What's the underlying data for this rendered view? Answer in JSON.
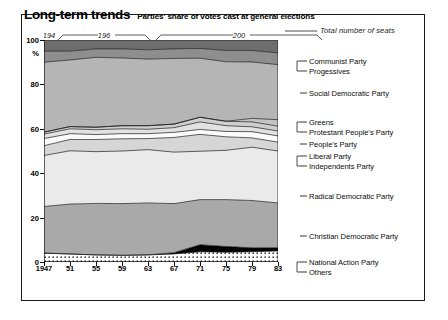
{
  "figure": {
    "title": "Long-term trends",
    "subtitle": "Parties' share of votes cast at general elections",
    "seats_note": "Total number of seats",
    "percent_symbol": "%"
  },
  "decade_brackets": [
    {
      "label": "194",
      "x_start": 0,
      "x_end": 10
    },
    {
      "label": "196",
      "x_start": 14,
      "x_end": 106
    },
    {
      "label": "200",
      "x_start": 112,
      "x_end": 278
    }
  ],
  "chart_data": {
    "type": "area",
    "title": "Long-term trends",
    "subtitle": "Parties' share of votes cast at general elections",
    "stacked": true,
    "normalized": true,
    "xlabel": "",
    "ylabel": "%",
    "xlim": [
      1947,
      1983
    ],
    "ylim": [
      0,
      100
    ],
    "grid": false,
    "legend_position": "right-outside",
    "x": [
      1947,
      1951,
      1955,
      1959,
      1963,
      1967,
      1971,
      1975,
      1979,
      1983
    ],
    "xtick_labels": [
      "1947",
      "51",
      "55",
      "59",
      "63",
      "67",
      "71",
      "75",
      "79",
      "83"
    ],
    "ytick_labels": [
      "0",
      "20",
      "40",
      "60",
      "80",
      "100"
    ],
    "ytick_values": [
      0,
      20,
      40,
      60,
      80,
      100
    ],
    "series_order_bottom_to_top": [
      "Others",
      "National Action Party",
      "Christian Democratic Party",
      "Radical Democratic Party",
      "Independents Party",
      "Liberal Party",
      "People's Party",
      "Protestant People's Party",
      "Greens",
      "Social Democratic Party",
      "Progessives",
      "Communist Party"
    ],
    "series": [
      {
        "name": "Others",
        "color": "#ffffff",
        "pattern": "dots",
        "values": [
          4.0,
          3.6,
          3.2,
          3.0,
          3.2,
          3.6,
          4.6,
          4.4,
          4.6,
          5.0
        ]
      },
      {
        "name": "National Action Party",
        "color": "#000000",
        "pattern": "solid",
        "values": [
          0.0,
          0.0,
          0.0,
          0.0,
          0.0,
          0.6,
          3.2,
          2.6,
          1.8,
          1.4
        ]
      },
      {
        "name": "Christian Democratic Party",
        "color": "#a9a9a9",
        "pattern": "solid",
        "values": [
          21.0,
          22.5,
          23.2,
          23.3,
          23.4,
          22.1,
          20.3,
          21.1,
          21.3,
          20.2
        ]
      },
      {
        "name": "Radical Democratic Party",
        "color": "#eaeaea",
        "pattern": "solid",
        "values": [
          23.0,
          24.0,
          23.3,
          23.7,
          24.0,
          23.2,
          21.8,
          22.2,
          24.0,
          23.4
        ]
      },
      {
        "name": "Independents Party",
        "color": "#d6d6d6",
        "pattern": "solid",
        "values": [
          4.4,
          5.1,
          5.5,
          5.5,
          5.0,
          6.6,
          7.6,
          6.1,
          4.2,
          4.0
        ]
      },
      {
        "name": "Liberal Party",
        "color": "#fbfbfb",
        "pattern": "solid",
        "values": [
          3.2,
          2.6,
          2.2,
          2.3,
          2.2,
          2.3,
          2.2,
          2.4,
          2.8,
          2.8
        ]
      },
      {
        "name": "People's Party",
        "color": "#e2e2e2",
        "pattern": "solid",
        "values": [
          2.0,
          2.2,
          2.2,
          2.2,
          2.0,
          2.1,
          3.4,
          2.6,
          2.2,
          2.2
        ]
      },
      {
        "name": "Protestant People's Party",
        "color": "#cfcfcf",
        "pattern": "solid",
        "values": [
          0.9,
          1.0,
          1.1,
          1.4,
          1.6,
          1.6,
          2.1,
          2.0,
          2.2,
          2.2
        ]
      },
      {
        "name": "Greens",
        "color": "#c4c4c4",
        "pattern": "solid",
        "values": [
          0.0,
          0.0,
          0.0,
          0.0,
          0.0,
          0.0,
          0.0,
          0.0,
          1.6,
          2.9
        ]
      },
      {
        "name": "Social Democratic Party",
        "color": "#b5b5b5",
        "pattern": "solid",
        "values": [
          31.5,
          30.0,
          31.5,
          30.5,
          30.0,
          29.6,
          26.6,
          26.8,
          25.4,
          24.8
        ]
      },
      {
        "name": "Progessives",
        "color": "#8e8e8e",
        "pattern": "solid",
        "values": [
          5.0,
          4.0,
          3.8,
          4.1,
          4.2,
          4.3,
          4.4,
          5.1,
          5.2,
          5.3
        ]
      },
      {
        "name": "Communist Party",
        "color": "#6e6e6e",
        "pattern": "solid",
        "values": [
          5.0,
          5.0,
          4.0,
          4.0,
          4.4,
          4.0,
          3.8,
          4.7,
          4.7,
          5.8
        ]
      }
    ]
  },
  "legend": [
    {
      "label": "Communist Party",
      "y": 61
    },
    {
      "label": "Progessives",
      "y": 71
    },
    {
      "label": "Social Democratic Party",
      "y": 93
    },
    {
      "label": "Greens",
      "y": 122
    },
    {
      "label": "Protestant People's Party",
      "y": 132
    },
    {
      "label": "People's Party",
      "y": 144
    },
    {
      "label": "Liberal Party",
      "y": 156
    },
    {
      "label": "Independents Party",
      "y": 166
    },
    {
      "label": "Radical Democratic Party",
      "y": 196
    },
    {
      "label": "Christian Democratic Party",
      "y": 236
    },
    {
      "label": "National Action Party",
      "y": 262
    },
    {
      "label": "Others",
      "y": 272
    }
  ]
}
